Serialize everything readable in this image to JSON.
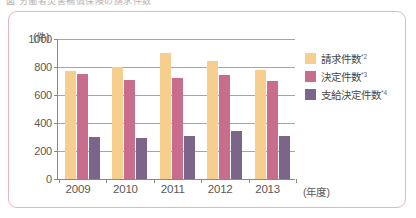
{
  "caption": {
    "text": "図    労働者災害補償保険の請求件数"
  },
  "chart_data": {
    "type": "bar",
    "title": "",
    "subtitle": "",
    "xlabel": "(年度)",
    "ylabel": "(件)",
    "ylim": [
      0,
      1000
    ],
    "ytick_values": [
      0,
      200,
      400,
      600,
      800,
      1000
    ],
    "ytick_labels": [
      "0",
      "200",
      "400",
      "600",
      "800",
      "1000"
    ],
    "grid": true,
    "legend_position": "right",
    "categories": [
      "2009",
      "2010",
      "2011",
      "2012",
      "2013"
    ],
    "series": [
      {
        "name": "請求件数",
        "footnote": "*2",
        "color": "#f6cf8e",
        "values": [
          770,
          800,
          900,
          840,
          780
        ]
      },
      {
        "name": "決定件数",
        "footnote": "*3",
        "color": "#c96d8c",
        "values": [
          750,
          710,
          720,
          740,
          700
        ]
      },
      {
        "name": "支給決定件数",
        "footnote": "*4",
        "color": "#7b6589",
        "values": [
          300,
          290,
          310,
          340,
          310
        ]
      }
    ]
  },
  "colors": {
    "frame_border": "#e6b4bd",
    "axis": "#8d8684",
    "gridline": "#aaa3a1",
    "text": "#5d5755",
    "background": "#ffffff"
  }
}
